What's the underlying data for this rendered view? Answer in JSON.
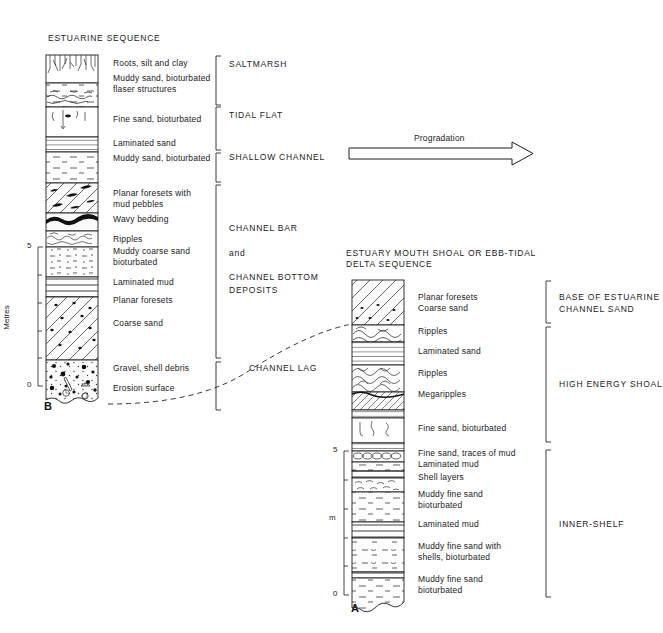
{
  "figure": {
    "title_left": "ESTUARINE SEQUENCE",
    "title_right": "ESTUARY MOUTH SHOAL OR EBB-TIDAL\nDELTA SEQUENCE",
    "progradation_label": "Progradation",
    "correlation_label": "CHANNEL LAG",
    "column_b_id": "B",
    "column_a_id": "A",
    "axis_left_title": "Metres",
    "axis_right_title": "m",
    "axis_left_ticks": [
      "5",
      "0"
    ],
    "axis_right_ticks": [
      "5",
      "0"
    ],
    "ink": "#1d1d1d"
  },
  "column_b": {
    "units": [
      {
        "label": "Roots, silt and clay",
        "pattern": "roots"
      },
      {
        "label": "Muddy sand, bioturbated\nflaser structures",
        "pattern": "flaser"
      },
      {
        "label": "Fine sand, bioturbated",
        "pattern": "burrows"
      },
      {
        "label": "Laminated sand",
        "pattern": "laminated"
      },
      {
        "label": "Muddy sand, bioturbated",
        "pattern": "muddy-dash"
      },
      {
        "label": "Planar foresets with\nmud pebbles",
        "pattern": "foresets-pebbles"
      },
      {
        "label": "Wavy bedding",
        "pattern": "wavy"
      },
      {
        "label": "Ripples",
        "pattern": "ripples"
      },
      {
        "label": "Muddy coarse sand\nbioturbated",
        "pattern": "muddy-coarse"
      },
      {
        "label": "Laminated mud",
        "pattern": "laminated-mud"
      },
      {
        "label": "Planar foresets",
        "pattern": "foresets"
      },
      {
        "label": "Coarse sand",
        "pattern": "foresets"
      },
      {
        "label": "Gravel, shell debris",
        "pattern": "gravel"
      },
      {
        "label": "Erosion surface",
        "pattern": "erosion"
      }
    ],
    "groups": [
      {
        "label": "SALTMARSH"
      },
      {
        "label": "TIDAL FLAT"
      },
      {
        "label": "SHALLOW CHANNEL"
      },
      {
        "label": "CHANNEL BAR\n\nand\n\nCHANNEL BOTTOM\nDEPOSITS"
      }
    ]
  },
  "column_a": {
    "units": [
      {
        "label": "Planar foresets\nCoarse sand",
        "pattern": "foresets"
      },
      {
        "label": "Ripples",
        "pattern": "ripples"
      },
      {
        "label": "Laminated sand",
        "pattern": "laminated"
      },
      {
        "label": "Ripples",
        "pattern": "ripples-big"
      },
      {
        "label": "Megaripples",
        "pattern": "megaripples"
      },
      {
        "label": "Fine sand, bioturbated",
        "pattern": "burrows"
      },
      {
        "label": "Fine sand, traces of mud",
        "pattern": "shells-row"
      },
      {
        "label": "Laminated mud",
        "pattern": "laminated-mud"
      },
      {
        "label": "Shell layers",
        "pattern": "shells"
      },
      {
        "label": "Muddy fine sand\nbioturbated",
        "pattern": "muddy-dash"
      },
      {
        "label": "Laminated mud",
        "pattern": "laminated-mud"
      },
      {
        "label": "Muddy fine sand with\nshells, bioturbated",
        "pattern": "muddy-shells"
      },
      {
        "label": "Muddy fine sand\nbioturbated",
        "pattern": "muddy-dash"
      }
    ],
    "groups": [
      {
        "label": "BASE OF ESTUARINE\nCHANNEL SAND"
      },
      {
        "label": "HIGH ENERGY SHOAL"
      },
      {
        "label": "INNER-SHELF"
      }
    ]
  }
}
